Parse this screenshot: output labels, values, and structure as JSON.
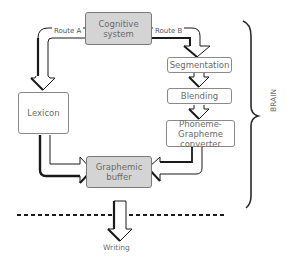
{
  "diagram": {
    "nodes": {
      "cognitive_system": {
        "label_line1": "Cognitive",
        "label_line2": "system",
        "fill": "#d4d4d4"
      },
      "lexicon": {
        "label": "Lexicon",
        "fill": "#ffffff"
      },
      "segmentation": {
        "label": "Segmentation",
        "fill": "#ffffff"
      },
      "blending": {
        "label": "Blending",
        "fill": "#ffffff"
      },
      "pg_converter": {
        "label_line1": "Phoneme-Grapheme",
        "label_line2": "converter",
        "fill": "#ffffff"
      },
      "graphemic_buffer": {
        "label_line1": "Graphemic",
        "label_line2": "buffer",
        "fill": "#d4d4d4"
      }
    },
    "routes": {
      "route_a": "Route A",
      "route_b": "Route B"
    },
    "brace_label": "BRAIN",
    "output_label": "Writing",
    "edges": [
      {
        "from": "cognitive_system",
        "to": "lexicon",
        "via": "Route A"
      },
      {
        "from": "cognitive_system",
        "to": "segmentation",
        "via": "Route B"
      },
      {
        "from": "segmentation",
        "to": "blending"
      },
      {
        "from": "blending",
        "to": "pg_converter"
      },
      {
        "from": "lexicon",
        "to": "graphemic_buffer"
      },
      {
        "from": "pg_converter",
        "to": "graphemic_buffer"
      },
      {
        "from": "graphemic_buffer",
        "to": "writing"
      }
    ],
    "colors": {
      "stroke": "#1a1a1a",
      "box_border": "#8a8a8a",
      "gray_fill": "#d4d4d4",
      "text": "#6b6b6b"
    }
  }
}
